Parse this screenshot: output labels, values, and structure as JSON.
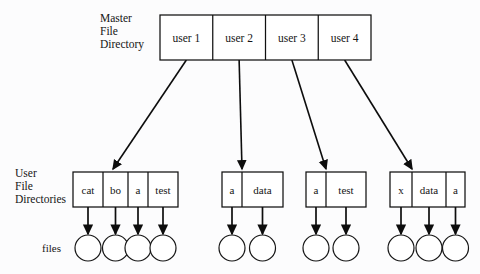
{
  "diagram": {
    "title_labels": {
      "master": [
        "Master",
        "File",
        "Directory"
      ],
      "user": [
        "User",
        "File",
        "Directories"
      ],
      "files": "files"
    },
    "master_directory": {
      "name": "master-file-directory",
      "x": 160,
      "y": 15,
      "width": 211,
      "height": 45,
      "cells": [
        {
          "label": "user 1"
        },
        {
          "label": "user 2"
        },
        {
          "label": "user 3"
        },
        {
          "label": "user 4"
        }
      ]
    },
    "user_directories": [
      {
        "name": "user-directory-1",
        "x": 73,
        "y": 172,
        "width": 105,
        "height": 35,
        "cells": [
          {
            "label": "cat",
            "width": 30
          },
          {
            "label": "bo",
            "width": 25
          },
          {
            "label": "a",
            "width": 20
          },
          {
            "label": "test",
            "width": 30
          }
        ],
        "arrow_target_x": 113
      },
      {
        "name": "user-directory-2",
        "x": 222,
        "y": 172,
        "width": 61,
        "height": 35,
        "cells": [
          {
            "label": "a",
            "width": 20
          },
          {
            "label": "data",
            "width": 41
          }
        ],
        "arrow_target_x": 242
      },
      {
        "name": "user-directory-3",
        "x": 306,
        "y": 172,
        "width": 60,
        "height": 35,
        "cells": [
          {
            "label": "a",
            "width": 20
          },
          {
            "label": "test",
            "width": 40
          }
        ],
        "arrow_target_x": 326
      },
      {
        "name": "user-directory-4",
        "x": 390,
        "y": 172,
        "width": 75,
        "height": 35,
        "cells": [
          {
            "label": "x",
            "width": 22
          },
          {
            "label": "data",
            "width": 34
          },
          {
            "label": "a",
            "width": 19
          }
        ],
        "arrow_target_x": 412
      }
    ],
    "file_nodes": {
      "circle_radius": 13,
      "circle_center_y": 248,
      "stem_top_y": 207,
      "groups": [
        {
          "directory": "user-directory-1",
          "count": 4
        },
        {
          "directory": "user-directory-2",
          "count": 2
        },
        {
          "directory": "user-directory-3",
          "count": 2
        },
        {
          "directory": "user-directory-4",
          "count": 3
        }
      ]
    },
    "master_links": [
      {
        "from_cell": 0,
        "to_directory": "user-directory-1"
      },
      {
        "from_cell": 1,
        "to_directory": "user-directory-2"
      },
      {
        "from_cell": 2,
        "to_directory": "user-directory-3"
      },
      {
        "from_cell": 3,
        "to_directory": "user-directory-4"
      }
    ],
    "labels_position": {
      "master_label_x": 100,
      "master_label_y": 22,
      "master_label_line_height": 13,
      "user_label_x": 15,
      "user_label_y": 177,
      "user_label_line_height": 13,
      "files_label_x": 42,
      "files_label_y": 252
    },
    "colors": {
      "stroke": "#101010",
      "text": "#151515",
      "background": "#fcfcfd",
      "box_fill": "#ffffff"
    }
  }
}
